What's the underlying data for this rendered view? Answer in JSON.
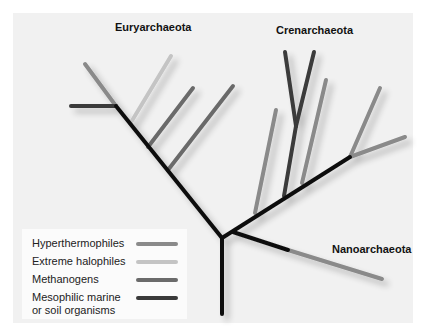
{
  "diagram": {
    "clades": [
      {
        "label": "Euryarchaeota"
      },
      {
        "label": "Crenarchaeota"
      },
      {
        "label": "Nanoarchaeota"
      }
    ],
    "legend": [
      {
        "label": "Hyperthermophiles",
        "color": "#8a8a8a"
      },
      {
        "label": "Extreme halophiles",
        "color": "#c4c4c4"
      },
      {
        "label": "Methanogens",
        "color": "#6b6b6b"
      },
      {
        "label": "Mesophilic marine or soil organisms",
        "color": "#3a3a3a"
      }
    ],
    "colors": {
      "trunk": "#111111",
      "background_panel": "#f1f1f1",
      "legend_background": "#fbfbfb"
    }
  }
}
